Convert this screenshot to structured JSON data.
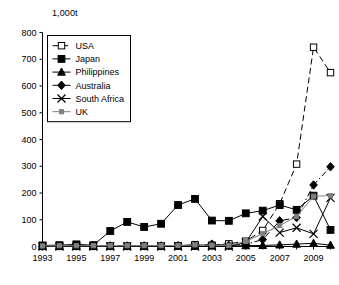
{
  "chart_data": {
    "type": "line",
    "title": "",
    "subtitle": "",
    "unit_label": "1,000t",
    "xlabel": "",
    "ylabel": "",
    "x": [
      1993,
      1994,
      1995,
      1996,
      1997,
      1998,
      1999,
      2000,
      2001,
      2002,
      2003,
      2004,
      2005,
      2006,
      2007,
      2008,
      2009,
      2010
    ],
    "xlim": [
      1993,
      2010
    ],
    "ylim": [
      0,
      800
    ],
    "yticks": [
      0,
      100,
      200,
      300,
      400,
      500,
      600,
      700,
      800
    ],
    "xticks": [
      1993,
      1995,
      1997,
      1999,
      2001,
      2003,
      2005,
      2007,
      2009
    ],
    "xtick_labels": [
      "1993",
      "1995",
      "1997",
      "1999",
      "2001",
      "2003",
      "2005",
      "2007",
      "2009"
    ],
    "ytick_labels": [
      "0",
      "100",
      "200",
      "300",
      "400",
      "500",
      "600",
      "700",
      "800"
    ],
    "grid": false,
    "legend_position": "upper left",
    "series": [
      {
        "name": "USA",
        "marker": "open-square",
        "linestyle": "dashed",
        "color": "#000000",
        "values": [
          2,
          2,
          2,
          2,
          2,
          2,
          2,
          2,
          3,
          7,
          5,
          10,
          20,
          60,
          160,
          308,
          745,
          650
        ]
      },
      {
        "name": "Japan",
        "marker": "filled-square",
        "linestyle": "solid",
        "color": "#000000",
        "values": [
          4,
          5,
          8,
          5,
          58,
          92,
          73,
          85,
          155,
          178,
          97,
          96,
          124,
          134,
          155,
          137,
          190,
          62
        ]
      },
      {
        "name": "Philippines",
        "marker": "filled-triangle",
        "linestyle": "solid",
        "color": "#000000",
        "values": [
          1,
          1,
          1,
          1,
          1,
          1,
          1,
          1,
          1,
          1,
          2,
          2,
          3,
          4,
          6,
          9,
          12,
          5
        ]
      },
      {
        "name": "Australia",
        "marker": "filled-diamond",
        "linestyle": "dash-dot",
        "color": "#000000",
        "values": [
          1,
          2,
          2,
          2,
          2,
          2,
          2,
          2,
          3,
          4,
          9,
          4,
          8,
          26,
          96,
          108,
          230,
          298
        ]
      },
      {
        "name": "South Africa",
        "marker": "cross-x",
        "linestyle": "solid",
        "color": "#000000",
        "values": [
          0,
          0,
          0,
          0,
          0,
          0,
          0,
          0,
          0,
          0,
          0,
          0,
          15,
          112,
          52,
          70,
          47,
          182
        ]
      },
      {
        "name": "UK",
        "marker": "small-square",
        "linestyle": "solid",
        "color": "#808080",
        "values": [
          2,
          3,
          3,
          3,
          3,
          3,
          3,
          3,
          4,
          6,
          5,
          4,
          19,
          48,
          78,
          112,
          188,
          190
        ]
      }
    ]
  }
}
